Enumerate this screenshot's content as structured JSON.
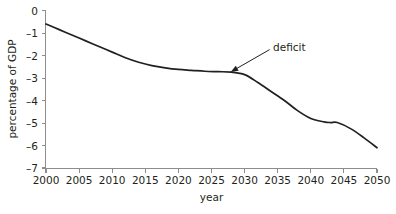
{
  "chart_data": {
    "type": "line",
    "title": "",
    "xlabel": "year",
    "ylabel": "percentage of GDP",
    "xlim": [
      2000,
      2050
    ],
    "ylim": [
      -7,
      0
    ],
    "grid": false,
    "legend": null,
    "x_ticks": [
      2000,
      2005,
      2010,
      2015,
      2020,
      2025,
      2030,
      2035,
      2040,
      2045,
      2050
    ],
    "x_tick_labels": [
      "2000",
      "2005",
      "2010",
      "2015",
      "2020",
      "2025",
      "2030",
      "2035",
      "2040",
      "2045",
      "2050"
    ],
    "y_ticks": [
      0,
      -1,
      -2,
      -3,
      -4,
      -5,
      -6,
      -7
    ],
    "y_tick_labels": [
      "0",
      "–1",
      "–2",
      "–3",
      "–4",
      "–5",
      "–6",
      "–7"
    ],
    "line_color": "#231f20",
    "axis_color": "#8d8d8d",
    "background_color": "#ffffff",
    "series": [
      {
        "name": "deficit",
        "x": [
          2000,
          2002,
          2004,
          2006,
          2008,
          2010,
          2012,
          2014,
          2016,
          2018,
          2020,
          2022,
          2024,
          2026,
          2028,
          2030,
          2032,
          2034,
          2036,
          2038,
          2040,
          2042,
          2043,
          2044,
          2046,
          2048,
          2050
        ],
        "values": [
          -0.6,
          -0.85,
          -1.1,
          -1.35,
          -1.6,
          -1.85,
          -2.1,
          -2.3,
          -2.45,
          -2.55,
          -2.62,
          -2.66,
          -2.7,
          -2.72,
          -2.74,
          -2.85,
          -3.2,
          -3.6,
          -4.0,
          -4.45,
          -4.8,
          -4.95,
          -4.98,
          -4.98,
          -5.25,
          -5.65,
          -6.1
        ]
      }
    ],
    "annotations": [
      {
        "text": "deficit",
        "label_x": 2034.3,
        "label_y": -1.65,
        "point_x": 2027.9,
        "point_y": -2.73
      }
    ]
  }
}
